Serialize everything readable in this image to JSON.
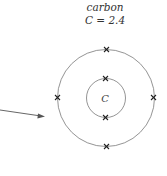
{
  "element": {
    "name": "carbon",
    "configuration": "C = 2.4",
    "symbol": "C"
  },
  "shells": [
    {
      "shell": 1,
      "electrons": 2
    },
    {
      "shell": 2,
      "electrons": 4
    }
  ],
  "colors": {
    "line": "#555555",
    "text": "#333333"
  }
}
